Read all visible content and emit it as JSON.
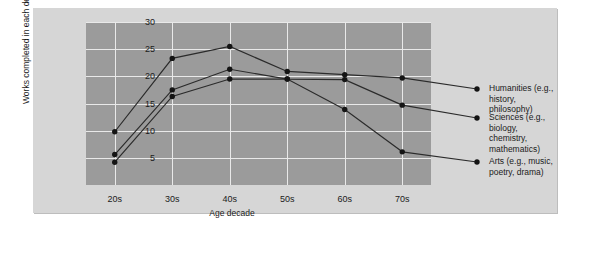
{
  "chart_data": {
    "type": "line",
    "title": "",
    "xlabel": "Age decade",
    "ylabel": "Works completed in each decade (%)",
    "categories": [
      "20s",
      "30s",
      "40s",
      "50s",
      "60s",
      "70s"
    ],
    "ylim": [
      0,
      30
    ],
    "yticks": [
      5,
      10,
      15,
      20,
      25,
      30
    ],
    "grid": true,
    "legend_position": "right",
    "series": [
      {
        "name": "Humanities (e.g.,\nhistory, philosophy)",
        "values": [
          9.8,
          23.3,
          25.5,
          20.9,
          20.3,
          19.7
        ]
      },
      {
        "name": "Sciences (e.g., biology,\nchemistry, mathematics)",
        "values": [
          5.6,
          17.5,
          21.3,
          19.5,
          19.4,
          14.7
        ]
      },
      {
        "name": "Arts (e.g., music,\npoetry, drama)",
        "values": [
          4.2,
          16.3,
          19.5,
          19.5,
          13.9,
          6.1
        ]
      }
    ]
  },
  "colors": {
    "figure_background": "#d6d6d6",
    "plot_background": "#9b9b9b",
    "gridline": "#e9e9e9",
    "line": "#2b2b2b",
    "marker": "#141414",
    "text": "#1b1b1b"
  }
}
